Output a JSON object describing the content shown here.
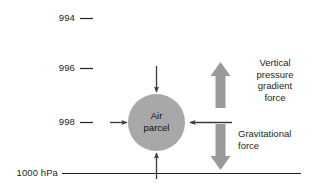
{
  "diagram": {
    "type": "physics-force-diagram",
    "background_color": "#ffffff",
    "ink_color": "#231f20",
    "parcel_fill_color": "#a8a8a8",
    "block_arrow_color": "#9a9a9a",
    "thin_arrow_color": "#3a3a3a",
    "pressure_axis": {
      "unit": "hPa",
      "levels": [
        {
          "id": "level-994",
          "label": "994",
          "value": 994,
          "tick": "dash"
        },
        {
          "id": "level-996",
          "label": "996",
          "value": 996,
          "tick": "dash"
        },
        {
          "id": "level-998",
          "label": "998",
          "value": 998,
          "tick": "dash"
        },
        {
          "id": "level-1000",
          "label": "1000 hPa",
          "value": 1000,
          "tick": "full-line"
        }
      ]
    },
    "parcel": {
      "label": "Air\nparcel",
      "line1": "Air",
      "line2": "parcel",
      "shape": "circle"
    },
    "pressure_arrows": {
      "description": "four thin arrows pointing inward at the air parcel",
      "directions": [
        "down",
        "up",
        "right",
        "left"
      ],
      "count": 4
    },
    "forces": [
      {
        "id": "vertical-pressure-gradient-force",
        "label": "Vertical\npressure\ngradient\nforce",
        "direction": "up",
        "arrow": "block-arrow-up"
      },
      {
        "id": "gravitational-force",
        "label": "Gravitational\nforce",
        "direction": "down",
        "arrow": "block-arrow-down"
      }
    ]
  }
}
